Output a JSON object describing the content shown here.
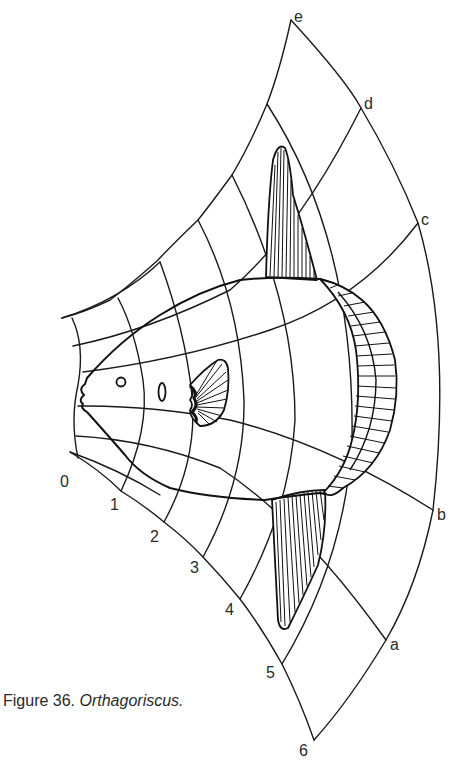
{
  "figure": {
    "caption_prefix": "Figure 36.",
    "caption_taxon": "Orthagoriscus."
  },
  "grid": {
    "axis_numbers": [
      "0",
      "1",
      "2",
      "3",
      "4",
      "5",
      "6"
    ],
    "axis_letters": [
      "a",
      "b",
      "c",
      "d",
      "e"
    ]
  },
  "colors": {
    "ink": "#1a1a1a",
    "paper": "#ffffff",
    "label": "#2a2a2a"
  }
}
